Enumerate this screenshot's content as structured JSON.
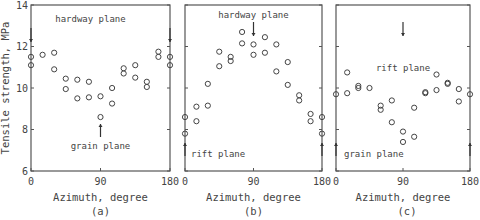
{
  "figure": {
    "ylabel": "Tensile strength, MPa",
    "panel_labels": [
      "(a)",
      "(b)",
      "(c)"
    ]
  },
  "chart_data": [
    {
      "type": "scatter",
      "panel": "(a)",
      "xlabel": "Azimuth, degree",
      "ylabel": "Tensile strength, MPa",
      "xlim": [
        0,
        180
      ],
      "ylim": [
        6,
        14
      ],
      "xticks": [
        0,
        90,
        180
      ],
      "yticks": [
        6,
        8,
        10,
        12,
        14
      ],
      "grid": false,
      "annotations": [
        {
          "text": "hardway plane",
          "x": 0,
          "arrow": "down"
        },
        {
          "text": "hardway plane",
          "x": 180,
          "arrow": "down"
        },
        {
          "text": "grain plane",
          "x": 90,
          "arrow": "up"
        }
      ],
      "points": [
        [
          0,
          11.5
        ],
        [
          0,
          11.1
        ],
        [
          15,
          11.6
        ],
        [
          30,
          11.7
        ],
        [
          30,
          10.9
        ],
        [
          45,
          10.45
        ],
        [
          45,
          9.95
        ],
        [
          60,
          10.4
        ],
        [
          60,
          9.5
        ],
        [
          75,
          10.3
        ],
        [
          75,
          9.55
        ],
        [
          90,
          9.6
        ],
        [
          90,
          8.6
        ],
        [
          105,
          10.0
        ],
        [
          105,
          9.25
        ],
        [
          120,
          10.95
        ],
        [
          120,
          10.7
        ],
        [
          135,
          11.1
        ],
        [
          135,
          10.5
        ],
        [
          150,
          10.3
        ],
        [
          150,
          10.05
        ],
        [
          165,
          11.75
        ],
        [
          165,
          11.5
        ],
        [
          180,
          11.5
        ],
        [
          180,
          11.1
        ]
      ]
    },
    {
      "type": "scatter",
      "panel": "(b)",
      "xlabel": "Azimuth, degree",
      "ylabel": "Tensile strength, MPa",
      "xlim": [
        0,
        180
      ],
      "ylim": [
        6,
        14
      ],
      "xticks": [
        0,
        90,
        180
      ],
      "yticks": [
        6,
        8,
        10,
        12,
        14
      ],
      "grid": false,
      "annotations": [
        {
          "text": "hardway plane",
          "x": 90,
          "arrow": "down"
        },
        {
          "text": "rift plane",
          "x": 0,
          "arrow": "up"
        },
        {
          "text": "rift plane",
          "x": 180,
          "arrow": "up"
        }
      ],
      "points": [
        [
          0,
          8.6
        ],
        [
          0,
          7.8
        ],
        [
          15,
          9.1
        ],
        [
          15,
          8.4
        ],
        [
          30,
          10.2
        ],
        [
          30,
          9.15
        ],
        [
          45,
          11.75
        ],
        [
          45,
          11.05
        ],
        [
          60,
          11.5
        ],
        [
          60,
          11.3
        ],
        [
          75,
          12.7
        ],
        [
          75,
          12.15
        ],
        [
          90,
          12.1
        ],
        [
          90,
          11.6
        ],
        [
          105,
          12.45
        ],
        [
          105,
          11.7
        ],
        [
          120,
          12.1
        ],
        [
          120,
          10.8
        ],
        [
          135,
          11.25
        ],
        [
          135,
          10.15
        ],
        [
          150,
          9.65
        ],
        [
          150,
          9.4
        ],
        [
          165,
          8.75
        ],
        [
          165,
          8.4
        ],
        [
          180,
          8.6
        ],
        [
          180,
          7.8
        ]
      ]
    },
    {
      "type": "scatter",
      "panel": "(c)",
      "xlabel": "Azimuth, degree",
      "ylabel": "Tensile strength, MPa",
      "xlim": [
        0,
        180
      ],
      "ylim": [
        6,
        14
      ],
      "xticks": [
        0,
        90,
        180
      ],
      "yticks": [
        6,
        8,
        10,
        12,
        14
      ],
      "grid": false,
      "annotations": [
        {
          "text": "rift plane",
          "x": 90,
          "arrow": "down"
        },
        {
          "text": "grain plane",
          "x": 0,
          "arrow": "up"
        },
        {
          "text": "grain plane",
          "x": 180,
          "arrow": "up"
        }
      ],
      "points": [
        [
          0,
          9.7
        ],
        [
          15,
          10.75
        ],
        [
          15,
          9.75
        ],
        [
          30,
          10.1
        ],
        [
          30,
          10.0
        ],
        [
          45,
          10.0
        ],
        [
          60,
          9.15
        ],
        [
          60,
          8.95
        ],
        [
          75,
          9.4
        ],
        [
          75,
          8.35
        ],
        [
          90,
          7.9
        ],
        [
          90,
          7.4
        ],
        [
          105,
          9.05
        ],
        [
          105,
          7.65
        ],
        [
          120,
          9.8
        ],
        [
          120,
          9.75
        ],
        [
          135,
          10.65
        ],
        [
          135,
          9.9
        ],
        [
          150,
          10.25
        ],
        [
          150,
          10.2
        ],
        [
          165,
          9.95
        ],
        [
          165,
          9.35
        ],
        [
          180,
          9.7
        ]
      ]
    }
  ]
}
